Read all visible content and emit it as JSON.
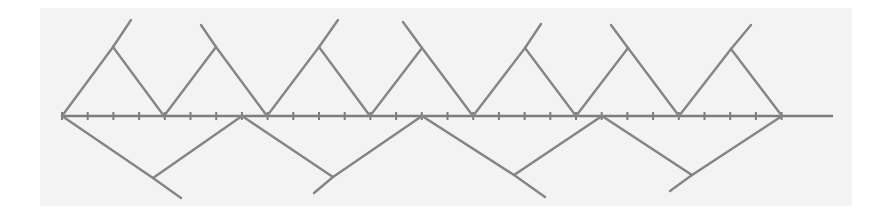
{
  "figure": {
    "colors": {
      "background": "#ffffff",
      "panel": "#f3f3f3",
      "line": "#858585",
      "axis": "#7d7d7d"
    },
    "axis": {
      "y": 116,
      "x_start": 62,
      "x_end": 833,
      "tick_spacing": 25.7,
      "tick_count": 29
    },
    "upper_zigzag": {
      "axis_points_x": [
        62,
        164,
        267,
        370,
        473,
        576,
        679,
        782
      ],
      "peaks": [
        {
          "x": 113,
          "y": 47,
          "tail": {
            "x": 131,
            "y": 20
          }
        },
        {
          "x": 216,
          "y": 47,
          "tail": {
            "x": 201,
            "y": 25
          }
        },
        {
          "x": 319,
          "y": 47,
          "tail": {
            "x": 338,
            "y": 20
          }
        },
        {
          "x": 422,
          "y": 48,
          "tail": {
            "x": 403,
            "y": 22
          }
        },
        {
          "x": 525,
          "y": 48,
          "tail": {
            "x": 541,
            "y": 24
          }
        },
        {
          "x": 628,
          "y": 48,
          "tail": {
            "x": 611,
            "y": 25
          }
        },
        {
          "x": 731,
          "y": 49,
          "tail": {
            "x": 751,
            "y": 25
          }
        }
      ]
    },
    "lower_zigzag": {
      "axis_points_x": [
        62,
        242,
        422,
        602,
        782
      ],
      "valleys": [
        {
          "x": 153,
          "y": 178,
          "tail": {
            "x": 181,
            "y": 198
          }
        },
        {
          "x": 333,
          "y": 177,
          "tail": {
            "x": 314,
            "y": 193
          }
        },
        {
          "x": 514,
          "y": 175,
          "tail": {
            "x": 545,
            "y": 197
          }
        },
        {
          "x": 692,
          "y": 175,
          "tail": {
            "x": 670,
            "y": 191
          }
        }
      ]
    }
  }
}
